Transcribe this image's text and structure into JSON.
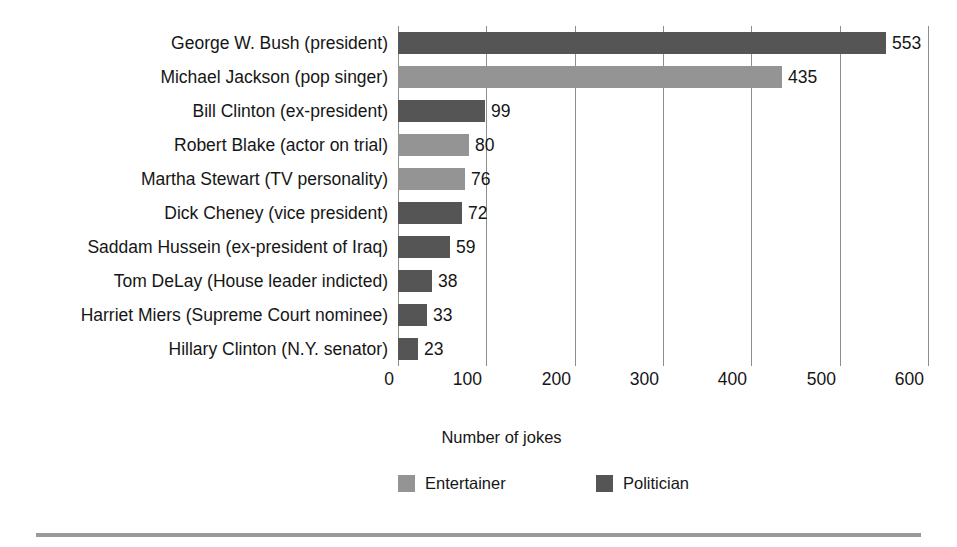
{
  "chart_data": {
    "type": "bar",
    "orientation": "horizontal",
    "title": "",
    "xlabel": "Number of jokes",
    "ylabel": "",
    "xlim": [
      0,
      600
    ],
    "xticks": [
      0,
      100,
      200,
      300,
      400,
      500,
      600
    ],
    "grid": "vertical",
    "legend_position": "bottom",
    "categories": [
      "George W. Bush (president)",
      "Michael Jackson (pop singer)",
      "Bill Clinton (ex-president)",
      "Robert Blake (actor on trial)",
      "Martha Stewart (TV personality)",
      "Dick Cheney (vice president)",
      "Saddam Hussein (ex-president of Iraq)",
      "Tom DeLay (House leader indicted)",
      "Harriet Miers (Supreme Court nominee)",
      "Hillary Clinton (N.Y. senator)"
    ],
    "values": [
      553,
      435,
      99,
      80,
      76,
      72,
      59,
      38,
      33,
      23
    ],
    "value_labels": [
      "553",
      "435",
      "99",
      "80",
      "76",
      "72",
      "59",
      "38",
      "33",
      "23"
    ],
    "groups": [
      "Politician",
      "Entertainer",
      "Politician",
      "Entertainer",
      "Entertainer",
      "Politician",
      "Politician",
      "Politician",
      "Politician",
      "Politician"
    ],
    "legend": [
      {
        "label": "Entertainer",
        "color": "#949494"
      },
      {
        "label": "Politician",
        "color": "#555555"
      }
    ],
    "colors": {
      "entertainer": "#949494",
      "politician": "#555555",
      "gridline": "#8e8e8e",
      "text": "#161616",
      "rule": "#9a9a9a",
      "background": "#ffffff"
    },
    "xtick_labels": [
      "0",
      "100",
      "200",
      "300",
      "400",
      "500",
      "600"
    ]
  }
}
